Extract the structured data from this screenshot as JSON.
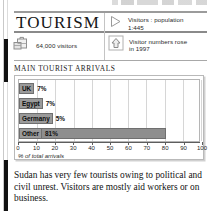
{
  "header": {
    "title": "TOURISM",
    "facts": [
      {
        "id": "ratio",
        "icon": "play-triangle-icon",
        "text": "Visitors : population\n1:445",
        "line1": "Visitors : population",
        "line2": "1:445"
      },
      {
        "id": "visitors",
        "icon": "suitcase-icon",
        "text": "64,000 visitors",
        "line1": "64,000 visitors",
        "line2": ""
      },
      {
        "id": "trend",
        "icon": "up-arrow-icon",
        "text": "Visitor numbers rose\nin 1997",
        "line1": "Visitor numbers rose",
        "line2": "in 1997"
      }
    ]
  },
  "section": {
    "heading": "MAIN TOURIST ARRIVALS"
  },
  "chart_data": {
    "type": "bar",
    "orientation": "horizontal",
    "title": "MAIN TOURIST ARRIVALS",
    "categories": [
      "UK",
      "Egypt",
      "Germany",
      "Other"
    ],
    "values": [
      7,
      7,
      5,
      81
    ],
    "value_labels": [
      "7%",
      "7%",
      "5%",
      "81%"
    ],
    "xlabel": "% of total arrivals",
    "ylabel": "",
    "xlim": [
      0,
      100
    ],
    "xticks": [
      0,
      10,
      20,
      30,
      40,
      50,
      60,
      70,
      80,
      90,
      100
    ],
    "xtick_labels": [
      "0",
      "10",
      "20",
      "30",
      "40",
      "50",
      "60",
      "70",
      "80",
      "90",
      "100"
    ],
    "grid": true,
    "legend": false,
    "bar_color": "#8e8e8e",
    "bar_border_color": "#6f6f6f",
    "label_bg_color": "#9a9a9a"
  },
  "body": {
    "paragraph": "Sudan has very few tourists owing to political and civil unrest. Visitors are mostly aid workers or on business."
  }
}
